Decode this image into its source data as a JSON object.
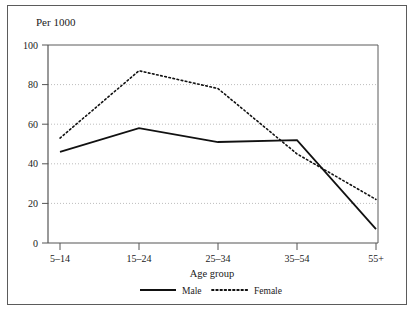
{
  "chart_data": {
    "type": "line",
    "title": "Per 1000",
    "xlabel": "Age group",
    "ylabel": "",
    "categories": [
      "5–14",
      "15–24",
      "25–34",
      "35–54",
      "55+"
    ],
    "series": [
      {
        "name": "Male",
        "values": [
          46,
          58,
          51,
          52,
          7
        ],
        "style": "solid"
      },
      {
        "name": "Female",
        "values": [
          53,
          87,
          78,
          45,
          22
        ],
        "style": "dotted"
      }
    ],
    "ylim": [
      0,
      100
    ],
    "yticks": [
      0,
      20,
      40,
      60,
      80,
      100
    ],
    "ytick_labels": [
      "0",
      "20",
      "40",
      "60",
      "80",
      "100"
    ],
    "grid": "horizontal-dotted",
    "legend_position": "bottom-center",
    "legend_entries": [
      "Male",
      "Female"
    ]
  },
  "figure": {
    "title_text": "Per 1000",
    "x_axis_title": "Age group"
  },
  "colors": {
    "line": "#111111",
    "grid": "#bdbdbd",
    "axis": "#555555",
    "frame": "#5b5b5b",
    "background": "#ffffff"
  }
}
